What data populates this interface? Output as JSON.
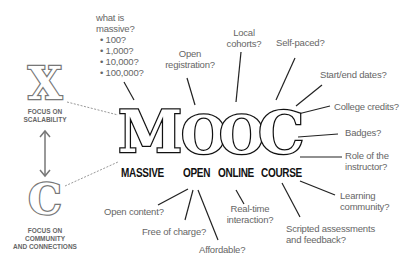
{
  "title_letters": [
    {
      "letter": "M",
      "word": "MASSIVE"
    },
    {
      "letter": "O",
      "word": "OPEN"
    },
    {
      "letter": "O",
      "word": "ONLINE"
    },
    {
      "letter": "C",
      "word": "COURSE"
    }
  ],
  "side": {
    "x": {
      "letter": "X",
      "label_lines": [
        "FOCUS ON",
        "SCALABILITY"
      ]
    },
    "c": {
      "letter": "C",
      "label_lines": [
        "FOCUS ON",
        "COMMUNITY",
        "AND CONNECTIONS"
      ]
    }
  },
  "massive_note": {
    "lines": [
      "what is",
      "massive?"
    ],
    "items": [
      "100?",
      "1,000?",
      "10,000?",
      "100,000?"
    ]
  },
  "open_notes": {
    "registration": [
      "Open",
      "registration?"
    ],
    "content": [
      "Open content?"
    ],
    "free": [
      "Free of charge?"
    ],
    "affordable": [
      "Affordable?"
    ]
  },
  "online_notes": {
    "cohorts": [
      "Local",
      "cohorts?"
    ],
    "realtime": [
      "Real-time",
      "interaction?"
    ]
  },
  "course_notes": {
    "selfpaced": [
      "Self-paced?"
    ],
    "startend": [
      "Start/end dates?"
    ],
    "credits": [
      "College credits?"
    ],
    "badges": [
      "Badges?"
    ],
    "instructor": [
      "Role of the",
      "instructor?"
    ],
    "community": [
      "Learning",
      "community?"
    ],
    "assessments": [
      "Scripted assessments",
      "and feedback?"
    ]
  },
  "colors": {
    "ink": "#111111",
    "note": "#666666",
    "connector": "#999999"
  }
}
